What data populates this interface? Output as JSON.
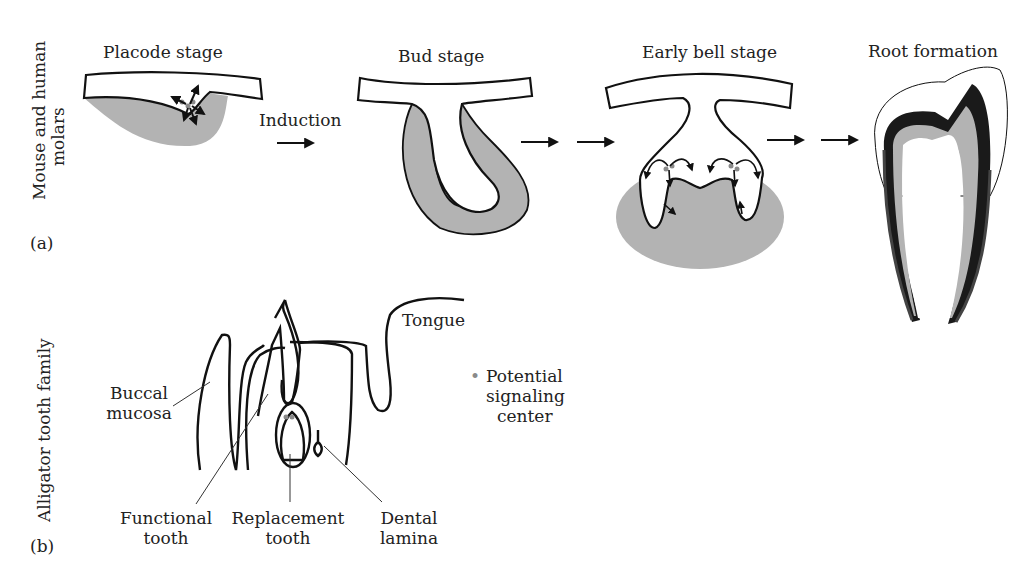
{
  "panel_a": {
    "label": "(a)",
    "row_label_line1": "Mouse and human",
    "row_label_line2": "molars",
    "stages": [
      {
        "title": "Placode stage"
      },
      {
        "title": "Bud stage"
      },
      {
        "title": "Early bell stage"
      },
      {
        "title": "Root formation"
      }
    ],
    "induction_label": "Induction"
  },
  "panel_b": {
    "label": "(b)",
    "row_label": "Alligator tooth family",
    "annotations": {
      "tongue": "Tongue",
      "buccal_line1": "Buccal",
      "buccal_line2": "mucosa",
      "functional_line1": "Functional",
      "functional_line2": "tooth",
      "replacement_line1": "Replacement",
      "replacement_line2": "tooth",
      "dental_line1": "Dental",
      "dental_line2": "lamina"
    }
  },
  "legend": {
    "bullet": "•",
    "line1": "Potential",
    "line2": "signaling",
    "line3": "center"
  },
  "colors": {
    "mesenchyme_gray": "#b3b3b3",
    "outline": "#111111",
    "signal_dot": "#8a8a8a",
    "dentin_dark": "#1a1a1a"
  }
}
